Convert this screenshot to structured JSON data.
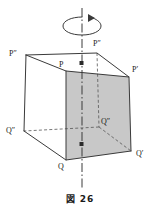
{
  "figure": {
    "caption": "図 26",
    "title_text": "図 26",
    "background_color": "#ffffff",
    "line_color": "#3a3a3a",
    "shaded_face_color": "#c8c8c8",
    "axis_label": "rotation-axis",
    "rotation_arrow": "curved-arrow-clockwise"
  },
  "labels": {
    "p": "P",
    "p_prime": "P′",
    "p_double_prime": "P″",
    "q": "Q",
    "q_prime": "Q′",
    "q_double_prime": "Q″",
    "q_inner": "Q″"
  },
  "geometry": {
    "type": "cube-oblique-projection",
    "shaded_face": "P-P'-Q'-Q",
    "axis": "vertical-dash-dot",
    "axis_markers": 2,
    "hidden_edges_style": "dashed",
    "vertices": {
      "P": [
        66,
        71
      ],
      "P_prime": [
        129,
        77
      ],
      "P_double_prime": [
        26,
        55
      ],
      "P_top_rear": [
        97,
        53
      ],
      "Q": [
        66,
        160
      ],
      "Q_prime": [
        131,
        151
      ],
      "Q_double_prime": [
        24,
        131
      ],
      "Q_inner": [
        99,
        127
      ]
    }
  }
}
